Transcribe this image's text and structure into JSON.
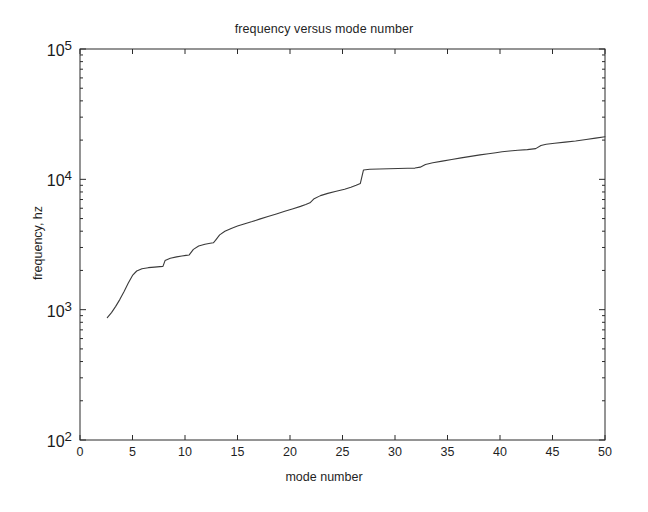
{
  "chart_data": {
    "type": "line",
    "title": "frequency versus mode number",
    "xlabel": "mode number",
    "ylabel": "frequency, hz",
    "yscale": "log",
    "xscale": "linear",
    "xlim": [
      0,
      50
    ],
    "ylim": [
      100,
      100000
    ],
    "xticks": [
      "0",
      "5",
      "10",
      "15",
      "20",
      "25",
      "30",
      "35",
      "40",
      "45",
      "50"
    ],
    "xtick_values": [
      0,
      5,
      10,
      15,
      20,
      25,
      30,
      35,
      40,
      45,
      50
    ],
    "ytick_labels": [
      "10^2",
      "10^3",
      "10^4",
      "10^5"
    ],
    "ytick_values": [
      100,
      1000,
      10000,
      100000
    ],
    "ytick_mantissas": [
      "10",
      "10",
      "10",
      "10"
    ],
    "ytick_exponents": [
      "2",
      "3",
      "4",
      "5"
    ],
    "grid": false,
    "legend": null,
    "line_color": "#3a3a3a",
    "series": [
      {
        "name": "frequency",
        "x": [
          2.6,
          3.0,
          3.4,
          3.8,
          4.2,
          4.6,
          5.0,
          5.4,
          5.9,
          6.5,
          7.1,
          7.6,
          7.9,
          8.1,
          8.6,
          9.2,
          9.7,
          10.1,
          10.4,
          10.8,
          11.3,
          11.9,
          12.4,
          12.7,
          12.9,
          13.3,
          13.8,
          14.4,
          15.0,
          15.7,
          16.4,
          17.1,
          17.9,
          18.7,
          19.5,
          20.3,
          21.0,
          21.5,
          21.9,
          22.3,
          22.9,
          23.6,
          24.4,
          25.2,
          25.8,
          26.3,
          26.7,
          27.0,
          27.6,
          28.5,
          29.4,
          30.3,
          31.2,
          31.9,
          32.4,
          32.9,
          33.6,
          34.5,
          35.4,
          36.3,
          37.2,
          38.1,
          38.9,
          39.6,
          40.2,
          40.9,
          41.7,
          42.6,
          43.4,
          43.9,
          44.4,
          45.2,
          46.2,
          47.2,
          48.2,
          49.1,
          50.0
        ],
        "y": [
          870,
          950,
          1060,
          1200,
          1380,
          1600,
          1830,
          1980,
          2060,
          2100,
          2120,
          2140,
          2150,
          2380,
          2480,
          2540,
          2580,
          2610,
          2630,
          2900,
          3080,
          3180,
          3230,
          3260,
          3400,
          3750,
          4000,
          4200,
          4380,
          4560,
          4740,
          4950,
          5180,
          5420,
          5680,
          5950,
          6200,
          6400,
          6600,
          7100,
          7500,
          7800,
          8100,
          8400,
          8700,
          9000,
          9300,
          11800,
          11950,
          12000,
          12050,
          12100,
          12150,
          12200,
          12400,
          13000,
          13400,
          13800,
          14200,
          14600,
          15000,
          15400,
          15700,
          16000,
          16300,
          16500,
          16700,
          16900,
          17200,
          18200,
          18600,
          18900,
          19300,
          19700,
          20200,
          20700,
          21200
        ]
      }
    ]
  }
}
